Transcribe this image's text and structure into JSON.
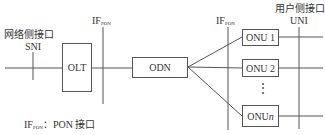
{
  "labels": {
    "sni_cn": "网络侧接口",
    "sni": "SNI",
    "ifpon_main": "IF",
    "ifpon_sub": "PON",
    "uni_cn": "用户侧接口",
    "uni": "UNI",
    "legend_main": "IF",
    "legend_sub": "PON",
    "legend_text": "：PON 接口"
  },
  "nodes": {
    "olt": "OLT",
    "odn": "ODN",
    "onu1": "ONU 1",
    "onu2": "ONU 2",
    "onun_prefix": "ONU ",
    "onun_n": "n",
    "dots": "⋮"
  }
}
